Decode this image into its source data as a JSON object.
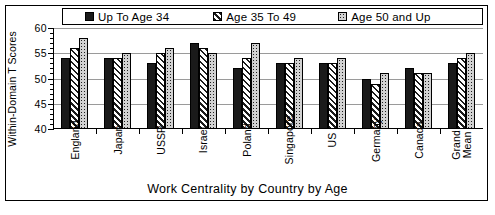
{
  "chart_data": {
    "type": "bar",
    "title": "",
    "xlabel": "Work Centrality by Country by Age",
    "ylabel": "Within-Domain T Scores",
    "ylim": [
      40,
      60
    ],
    "yticks": [
      40,
      45,
      50,
      55,
      60
    ],
    "ytick_labels": [
      "40",
      "45",
      "50",
      "55",
      "60"
    ],
    "minor_tick_step": 1,
    "grid": true,
    "legend_position": "top",
    "categories": [
      "England",
      "Japan",
      "USSR",
      "Israel",
      "Poland",
      "Singapore",
      "US",
      "Germany",
      "Canada",
      "Grand Mean"
    ],
    "series": [
      {
        "name": "Up To Age 34",
        "pattern": "solid",
        "values": [
          54,
          54,
          53,
          57,
          52,
          53,
          53,
          50,
          52,
          53
        ]
      },
      {
        "name": "Age 35 To 49",
        "pattern": "hatch",
        "values": [
          56,
          54,
          55,
          56,
          54,
          53,
          53,
          49,
          51,
          54
        ]
      },
      {
        "name": "Age 50 and Up",
        "pattern": "dots",
        "values": [
          58,
          55,
          56,
          55,
          57,
          54,
          54,
          51,
          51,
          55
        ]
      }
    ]
  },
  "legend": {
    "items": [
      {
        "label": "Up To Age 34",
        "swatch": "solid-square-icon"
      },
      {
        "label": "Age 35 To 49",
        "swatch": "hatched-square-icon"
      },
      {
        "label": "Age 50 and Up",
        "swatch": "dotted-square-icon"
      }
    ]
  },
  "axes": {
    "y_title": "Within-Domain T Scores",
    "x_title": "Work Centrality by Country by Age"
  },
  "colors": {
    "series_1": "#1a1a1a",
    "series_2": "#ffffff",
    "series_3": "#d2d2d2",
    "axis": "#000000",
    "grid": "#9a9a9a",
    "background": "#ffffff"
  }
}
